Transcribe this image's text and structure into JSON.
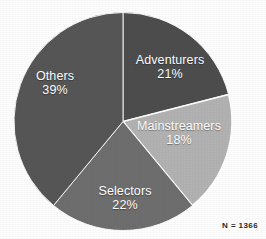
{
  "chart_data": {
    "type": "pie",
    "title": "",
    "subtitle": "",
    "xlabel": "",
    "ylabel": "",
    "legend_position": "none",
    "grid": false,
    "labels_inside_slices": true,
    "start_angle_deg": 0,
    "direction": "clockwise",
    "categories": [
      "Adventurers",
      "Mainstreamers",
      "Selectors",
      "Others"
    ],
    "values": [
      21,
      18,
      22,
      39
    ],
    "value_unit": "%",
    "slices": [
      {
        "name": "Adventurers",
        "value": 21,
        "label": "Adventurers",
        "value_label": "21%",
        "color": "#4d4d4d",
        "start_deg": 0,
        "end_deg": 75.6
      },
      {
        "name": "Mainstreamers",
        "value": 18,
        "label": "Mainstreamers",
        "value_label": "18%",
        "color": "#b2b2b2",
        "start_deg": 75.6,
        "end_deg": 140.4
      },
      {
        "name": "Selectors",
        "value": 22,
        "label": "Selectors",
        "value_label": "22%",
        "color": "#6e6e6e",
        "start_deg": 140.4,
        "end_deg": 219.6
      },
      {
        "name": "Others",
        "value": 39,
        "label": "Others",
        "value_label": "39%",
        "color": "#565656",
        "start_deg": 219.6,
        "end_deg": 360
      }
    ],
    "annotations": [
      {
        "name": "sample-size",
        "text": "N = 1366"
      }
    ],
    "colors": {
      "background": "#fdfdfd",
      "label_text": "#ffffff",
      "note_text": "#2b2b2b",
      "slice_outline": "#ffffff"
    }
  },
  "note": {
    "sample_size": "N = 1366"
  }
}
